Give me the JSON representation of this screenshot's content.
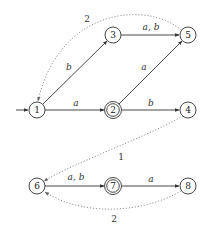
{
  "diagram": {
    "type": "automaton",
    "nodes": [
      {
        "id": "1",
        "label": "1",
        "x": 37,
        "y": 110,
        "accepting": false,
        "initial": true
      },
      {
        "id": "2",
        "label": "2",
        "x": 113,
        "y": 110,
        "accepting": true
      },
      {
        "id": "3",
        "label": "3",
        "x": 113,
        "y": 35,
        "accepting": false
      },
      {
        "id": "4",
        "label": "4",
        "x": 188,
        "y": 110,
        "accepting": false
      },
      {
        "id": "5",
        "label": "5",
        "x": 188,
        "y": 35,
        "accepting": false
      },
      {
        "id": "6",
        "label": "6",
        "x": 37,
        "y": 186,
        "accepting": false
      },
      {
        "id": "7",
        "label": "7",
        "x": 113,
        "y": 186,
        "accepting": true
      },
      {
        "id": "8",
        "label": "8",
        "x": 188,
        "y": 186,
        "accepting": false
      }
    ],
    "edges": [
      {
        "from": "1",
        "to": "2",
        "label": "a",
        "style": "solid"
      },
      {
        "from": "1",
        "to": "3",
        "label": "b",
        "style": "solid"
      },
      {
        "from": "3",
        "to": "5",
        "label": "a, b",
        "style": "solid"
      },
      {
        "from": "2",
        "to": "5",
        "label": "a",
        "style": "solid"
      },
      {
        "from": "2",
        "to": "4",
        "label": "b",
        "style": "solid"
      },
      {
        "from": "6",
        "to": "7",
        "label": "a, b",
        "style": "solid"
      },
      {
        "from": "7",
        "to": "8",
        "label": "a",
        "style": "solid"
      },
      {
        "from": "5",
        "to": "1",
        "label": "2",
        "style": "dotted"
      },
      {
        "from": "4",
        "to": "6",
        "label": "1",
        "style": "dotted"
      },
      {
        "from": "8",
        "to": "6",
        "label": "2",
        "style": "dotted"
      }
    ]
  },
  "labels": {
    "e12": "a",
    "e13": "b",
    "e35": "a, b",
    "e25": "a",
    "e24": "b",
    "e67": "a, b",
    "e78": "a",
    "d51": "2",
    "d46": "1",
    "d86": "2"
  },
  "nodes": {
    "n1": "1",
    "n2": "2",
    "n3": "3",
    "n4": "4",
    "n5": "5",
    "n6": "6",
    "n7": "7",
    "n8": "8"
  }
}
